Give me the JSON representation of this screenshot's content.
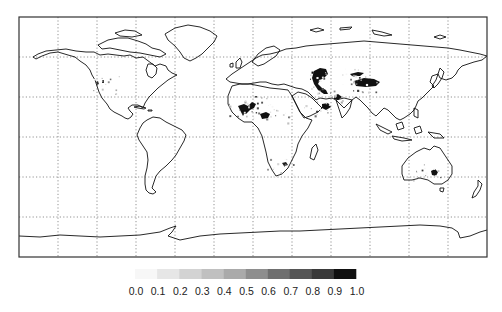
{
  "figure": {
    "projection": "equirectangular",
    "extent": {
      "lon": [
        -180,
        180
      ],
      "lat": [
        -90,
        90
      ]
    },
    "gridlines": {
      "lon_step_deg": 30,
      "lat_step_deg": 30,
      "style": "dotted"
    },
    "background_color": "#ffffff",
    "coastline_color": "#111111"
  },
  "colorbar": {
    "orientation": "horizontal",
    "placement": "bottom-center",
    "tick_labels": [
      "0.0",
      "0.1",
      "0.2",
      "0.3",
      "0.4",
      "0.5",
      "0.6",
      "0.7",
      "0.8",
      "0.9",
      "1.0"
    ],
    "bins": [
      {
        "range": [
          0.0,
          0.1
        ],
        "color": "#f7f7f7"
      },
      {
        "range": [
          0.1,
          0.2
        ],
        "color": "#e6e6e6"
      },
      {
        "range": [
          0.2,
          0.3
        ],
        "color": "#d3d3d3"
      },
      {
        "range": [
          0.3,
          0.4
        ],
        "color": "#c0c0c0"
      },
      {
        "range": [
          0.4,
          0.5
        ],
        "color": "#aaaaaa"
      },
      {
        "range": [
          0.5,
          0.6
        ],
        "color": "#8e8e8e"
      },
      {
        "range": [
          0.6,
          0.7
        ],
        "color": "#6f6f6f"
      },
      {
        "range": [
          0.7,
          0.8
        ],
        "color": "#555555"
      },
      {
        "range": [
          0.8,
          0.9
        ],
        "color": "#3a3a3a"
      },
      {
        "range": [
          0.9,
          1.0
        ],
        "color": "#111111"
      }
    ]
  },
  "high_value_regions": [
    {
      "name": "Caspian / Turan lowland",
      "lon": 52,
      "lat": 43,
      "value": 1.0
    },
    {
      "name": "Taklamakan / Tarim basin",
      "lon": 85,
      "lat": 39,
      "value": 0.95
    },
    {
      "name": "Junggar / Gobi west",
      "lon": 78,
      "lat": 45,
      "value": 0.95
    },
    {
      "name": "Northern Sahara (Algeria)",
      "lon": 3,
      "lat": 25,
      "value": 0.95
    },
    {
      "name": "Sahara east (Libya/Chad)",
      "lon": 18,
      "lat": 17,
      "value": 0.9
    },
    {
      "name": "Arabian peninsula",
      "lon": 50,
      "lat": 22,
      "value": 0.85
    },
    {
      "name": "Iran / Afghanistan",
      "lon": 60,
      "lat": 30,
      "value": 0.85
    },
    {
      "name": "Central Australia",
      "lon": 134,
      "lat": -26,
      "value": 0.9
    },
    {
      "name": "Kalahari",
      "lon": 21,
      "lat": -23,
      "value": 0.8
    },
    {
      "name": "Great Basin (USA)",
      "lon": -113,
      "lat": 39,
      "value": 0.7
    },
    {
      "name": "Mauritania / Western Sahara",
      "lon": -10,
      "lat": 21,
      "value": 0.9
    }
  ]
}
